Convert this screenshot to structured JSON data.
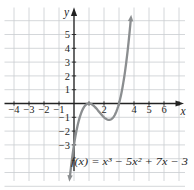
{
  "figure": {
    "background": "#ffffff",
    "grid_color": "#c9cdd1",
    "axis_color": "#222222",
    "text_color": "#1f1f1f",
    "curve_color": "#8b8e90"
  },
  "chart_data": {
    "type": "line",
    "subtype": "function-plot",
    "title": "",
    "formula_display": "f(x) = x³ − 5x² + 7x − 3",
    "function": "f(x) = x^3 - 5x^2 + 7x - 3",
    "coefficients_asc": [
      -3,
      7,
      -5,
      1
    ],
    "x_axis_label": "x",
    "y_axis_label": "y",
    "xlim": [
      -4.6,
      7.4
    ],
    "ylim": [
      -6.2,
      6.9
    ],
    "grid": true,
    "legend": false,
    "x_tick_labels": [
      "−4",
      "−3",
      "−2",
      "−1",
      "2",
      "4",
      "5",
      "6"
    ],
    "x_tick_label_values": [
      -4,
      -3,
      -2,
      -1,
      2,
      4,
      5,
      6
    ],
    "y_tick_labels": [
      "5",
      "4",
      "3",
      "2",
      "1",
      "−1",
      "−2",
      "−3"
    ],
    "y_tick_label_values": [
      5,
      4,
      3,
      2,
      1,
      -1,
      -2,
      -3
    ],
    "x_ticks_marked": [
      -4,
      -3,
      -2,
      -1,
      1,
      2,
      3,
      4,
      5,
      6,
      7
    ],
    "y_ticks_marked": [
      -3,
      -2,
      -1,
      1,
      2,
      3,
      4,
      5
    ],
    "plot_domain": [
      -0.27,
      3.78
    ],
    "key_points": [
      {
        "x": 0,
        "y": -3,
        "label": "y-intercept"
      },
      {
        "x": 1,
        "y": 0,
        "label": "double root, local maximum"
      },
      {
        "x": 2.33,
        "y": -1.19,
        "label": "local minimum"
      },
      {
        "x": 3,
        "y": 0,
        "label": "x-intercept"
      }
    ]
  }
}
